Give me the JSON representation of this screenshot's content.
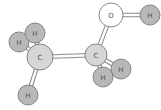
{
  "diagram": {
    "molecule": "ethanol",
    "colors": {
      "hydrogen": "#b8b8b8",
      "carbon": "#d6d6d6",
      "oxygen": "#ffffff",
      "outline": "#7a7a7a",
      "bond": "#8a8a8a"
    },
    "atoms": [
      {
        "id": "O",
        "label": "O",
        "x": 111,
        "y": 15,
        "r": 12
      },
      {
        "id": "H1",
        "label": "H",
        "x": 150,
        "y": 15,
        "r": 10
      },
      {
        "id": "C2",
        "label": "C",
        "x": 96,
        "y": 55,
        "r": 11
      },
      {
        "id": "C1",
        "label": "C",
        "x": 40,
        "y": 57,
        "r": 13
      },
      {
        "id": "H2",
        "label": "H",
        "x": 35,
        "y": 33,
        "r": 10
      },
      {
        "id": "H3",
        "label": "H",
        "x": 19,
        "y": 42,
        "r": 10
      },
      {
        "id": "H4",
        "label": "H",
        "x": 28,
        "y": 95,
        "r": 10
      },
      {
        "id": "H5",
        "label": "H",
        "x": 121,
        "y": 69,
        "r": 10
      },
      {
        "id": "H6",
        "label": "H",
        "x": 103,
        "y": 77,
        "r": 10
      }
    ],
    "bonds": [
      [
        "O",
        "H1"
      ],
      [
        "O",
        "C2"
      ],
      [
        "C1",
        "C2"
      ],
      [
        "C1",
        "H2"
      ],
      [
        "C1",
        "H3"
      ],
      [
        "C1",
        "H4"
      ],
      [
        "C2",
        "H5"
      ],
      [
        "C2",
        "H6"
      ]
    ]
  }
}
